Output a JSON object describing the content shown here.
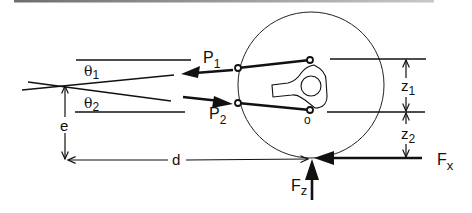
{
  "figure": {
    "colors": {
      "ink": "#111111",
      "rule": "#8a8a8a",
      "background": "#ffffff"
    }
  },
  "labels": {
    "p1": {
      "main": "P",
      "sub": "1"
    },
    "p2": {
      "main": "P",
      "sub": "2"
    },
    "theta1": {
      "main": "θ",
      "sub": "1"
    },
    "theta2": {
      "main": "θ",
      "sub": "2"
    },
    "z1": {
      "main": "z",
      "sub": "1"
    },
    "z2": {
      "main": "z",
      "sub": "2"
    },
    "fx": {
      "main": "F",
      "sub": "x"
    },
    "fz": {
      "main": "F",
      "sub": "z"
    },
    "e": "e",
    "d": "d",
    "origin": "o"
  }
}
